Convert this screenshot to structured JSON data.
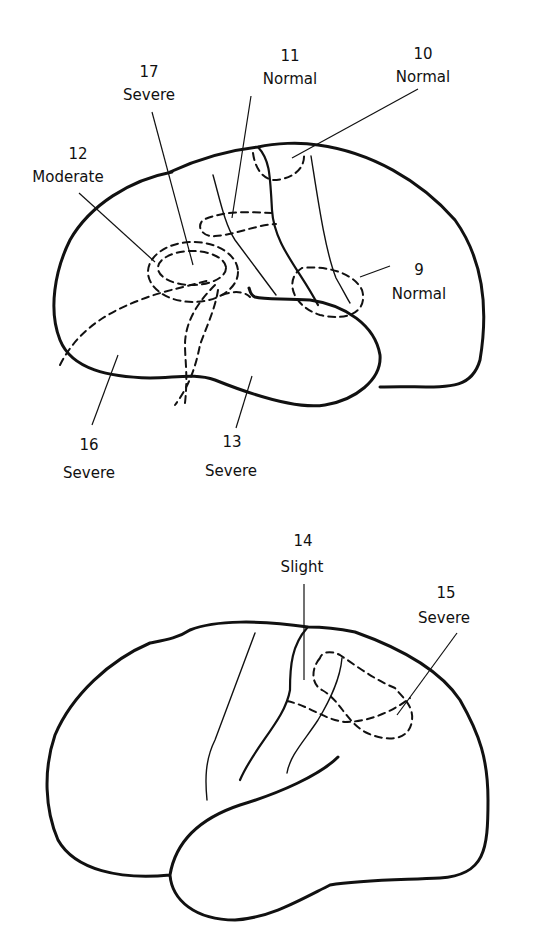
{
  "diagram": {
    "type": "lateral brain view annotations",
    "figures": [
      {
        "id": "upper",
        "regions": [
          {
            "number": "17",
            "severity": "Severe"
          },
          {
            "number": "11",
            "severity": "Normal"
          },
          {
            "number": "10",
            "severity": "Normal"
          },
          {
            "number": "12",
            "severity": "Moderate"
          },
          {
            "number": "9",
            "severity": "Normal"
          },
          {
            "number": "16",
            "severity": "Severe"
          },
          {
            "number": "13",
            "severity": "Severe"
          }
        ]
      },
      {
        "id": "lower",
        "regions": [
          {
            "number": "14",
            "severity": "Slight"
          },
          {
            "number": "15",
            "severity": "Severe"
          }
        ]
      }
    ]
  },
  "labels": {
    "r17": {
      "num": "17",
      "sev": "Severe"
    },
    "r11": {
      "num": "11",
      "sev": "Normal"
    },
    "r10": {
      "num": "10",
      "sev": "Normal"
    },
    "r12": {
      "num": "12",
      "sev": "Moderate"
    },
    "r9": {
      "num": "9",
      "sev": "Normal"
    },
    "r16": {
      "num": "16",
      "sev": "Severe"
    },
    "r13": {
      "num": "13",
      "sev": "Severe"
    },
    "r14": {
      "num": "14",
      "sev": "Slight"
    },
    "r15": {
      "num": "15",
      "sev": "Severe"
    }
  },
  "colors": {
    "ink": "#111111",
    "background": "#ffffff"
  }
}
